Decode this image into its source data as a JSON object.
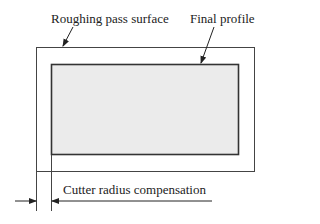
{
  "diagram": {
    "type": "machining-profile",
    "labels": {
      "roughing": "Roughing pass surface",
      "final": "Final profile",
      "compensation": "Cutter radius compensation"
    },
    "colors": {
      "stroke": "#333333",
      "fill": "#ebebeb",
      "background": "#ffffff"
    }
  }
}
